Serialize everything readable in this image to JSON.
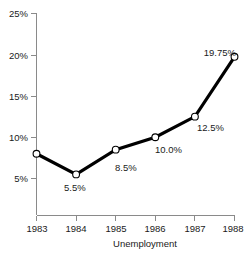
{
  "chart_data": {
    "type": "line",
    "title": "",
    "subtitle": "",
    "xlabel": "Unemployment",
    "ylabel": "",
    "categories": [
      "1983",
      "1984",
      "1985",
      "1986",
      "1987",
      "1988"
    ],
    "x": [
      1983,
      1984,
      1985,
      1986,
      1987,
      1988
    ],
    "values": [
      8.0,
      5.5,
      8.5,
      10.0,
      12.5,
      19.75
    ],
    "point_labels": [
      "",
      "5.5%",
      "8.5%",
      "10.0%",
      "12.5%",
      "19.75%"
    ],
    "xlim": [
      1983,
      1988
    ],
    "ylim": [
      0,
      25
    ],
    "y_ticks": [
      5,
      10,
      15,
      20,
      25
    ],
    "y_tick_labels": [
      "5%",
      "10%",
      "15%",
      "20%",
      "25%"
    ],
    "x_ticks": [
      1983,
      1984,
      1985,
      1986,
      1987,
      1988
    ],
    "x_tick_labels": [
      "1983",
      "1984",
      "1985",
      "1986",
      "1987",
      "1988"
    ],
    "grid": false,
    "legend": false,
    "legend_position": "none",
    "series": [
      {
        "name": "Unemployment",
        "values": [
          8.0,
          5.5,
          8.5,
          10.0,
          12.5,
          19.75
        ],
        "line_color": "#000000",
        "marker_fill": "#ffffff",
        "marker_edge": "#000000"
      }
    ],
    "colors": {
      "background": "#ffffff",
      "axis": "#8a8a8a",
      "text": "#1a1a1a",
      "line": "#000000",
      "marker_fill": "#ffffff"
    }
  },
  "axes": {
    "y_labels": [
      "25%",
      "20%",
      "15%",
      "10%",
      "5%"
    ],
    "x_labels": [
      "1983",
      "1984",
      "1985",
      "1986",
      "1987",
      "1988"
    ],
    "x_axis_title": "Unemployment"
  },
  "data_labels": {
    "p1984": "5.5%",
    "p1985": "8.5%",
    "p1986": "10.0%",
    "p1987": "12.5%",
    "p1988": "19.75%"
  }
}
